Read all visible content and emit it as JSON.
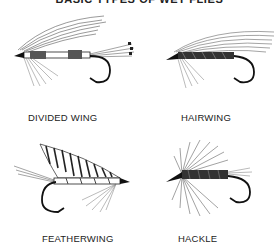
{
  "title": "BASIC TYPES OF WET FLIES",
  "figures": [
    {
      "id": "divided-wing",
      "label": "DIVIDED WING"
    },
    {
      "id": "hairwing",
      "label": "HAIRWING"
    },
    {
      "id": "featherwing",
      "label": "FEATHERWING"
    },
    {
      "id": "hackle",
      "label": "HACKLE"
    }
  ],
  "colors": {
    "ink": "#1a1a1a",
    "background": "#ffffff",
    "gray_fiber": "#8a8a8a"
  }
}
